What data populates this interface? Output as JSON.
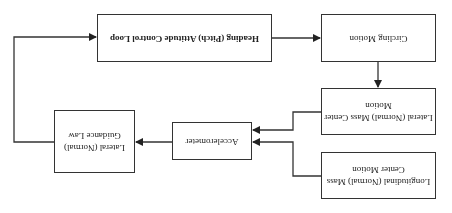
{
  "diagram": {
    "orientation": "rotated 180 degrees",
    "nodes": {
      "heading_loop": "Heading (Pitch) Attitude Control Loop",
      "circling_motion": "Circling Motion",
      "lateral_mass": "Lateral (Normal) Mass Center Motion",
      "longitudinal_mass": "Longitudinal (Normal) Mass Center Motion",
      "accelerometer": "Accelerometer",
      "guidance_law": "Lateral (Normal) Guidance Law"
    },
    "edges": [
      {
        "from": "heading_loop",
        "to": "circling_motion"
      },
      {
        "from": "circling_motion",
        "to": "lateral_mass"
      },
      {
        "from": "lateral_mass",
        "to": "accelerometer"
      },
      {
        "from": "longitudinal_mass",
        "to": "accelerometer"
      },
      {
        "from": "accelerometer",
        "to": "guidance_law"
      },
      {
        "from": "guidance_law",
        "to": "heading_loop"
      }
    ],
    "colors": {
      "line": "#333333",
      "background": "#ffffff"
    }
  }
}
